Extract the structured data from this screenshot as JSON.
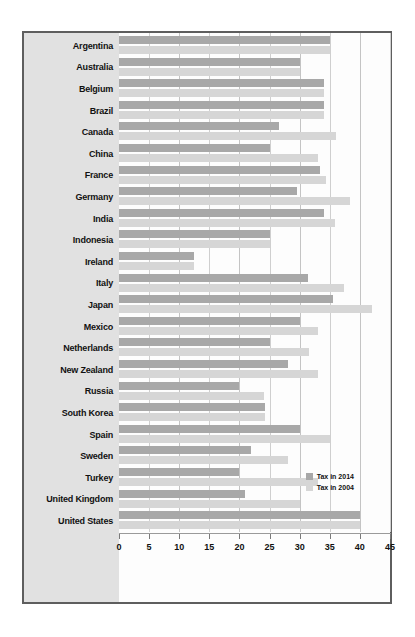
{
  "chart_data": {
    "type": "bar",
    "orientation": "horizontal",
    "title": "",
    "xlabel": "",
    "ylabel": "",
    "xlim": [
      0,
      45
    ],
    "xticks": [
      0,
      5,
      10,
      15,
      20,
      25,
      30,
      35,
      40,
      45
    ],
    "grid": true,
    "legend_position": "bottom-right",
    "categories": [
      "Argentina",
      "Australia",
      "Belgium",
      "Brazil",
      "Canada",
      "China",
      "France",
      "Germany",
      "India",
      "Indonesia",
      "Ireland",
      "Italy",
      "Japan",
      "Mexico",
      "Netherlands",
      "New Zealand",
      "Russia",
      "South Korea",
      "Spain",
      "Sweden",
      "Turkey",
      "United Kingdom",
      "United States"
    ],
    "series": [
      {
        "name": "Tax in 2014",
        "color": "#a8a8a8",
        "values": [
          35.0,
          30.0,
          34.0,
          34.0,
          26.5,
          25.0,
          33.3,
          29.6,
          34.0,
          25.0,
          12.5,
          31.4,
          35.6,
          30.0,
          25.0,
          28.0,
          20.0,
          24.2,
          30.0,
          22.0,
          20.0,
          21.0,
          40.0
        ]
      },
      {
        "name": "Tax in 2004",
        "color": "#d6d6d6",
        "values": [
          35.0,
          30.0,
          34.0,
          34.0,
          36.1,
          33.0,
          34.4,
          38.3,
          35.9,
          25.0,
          12.5,
          37.3,
          42.0,
          33.0,
          31.5,
          33.0,
          24.0,
          24.2,
          35.0,
          28.0,
          33.0,
          30.0,
          40.0
        ]
      }
    ]
  },
  "legend": {
    "items": [
      {
        "label": "Tax in 2014",
        "color": "#a8a8a8"
      },
      {
        "label": "Tax in 2004",
        "color": "#d6d6d6"
      }
    ]
  },
  "axis": {
    "tick_labels": [
      "0",
      "5",
      "10",
      "15",
      "20",
      "25",
      "30",
      "35",
      "40",
      "45"
    ]
  },
  "colors": {
    "series_2014": "#a8a8a8",
    "series_2004": "#d6d6d6",
    "frame_border": "#5e5e5e",
    "label_panel": "#e1e1e1",
    "plot_background": "#fdfdfd",
    "gridline": "#cfcfcf"
  }
}
